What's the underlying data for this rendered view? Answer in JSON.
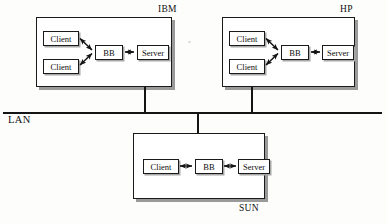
{
  "diagram": {
    "type": "network-architecture",
    "bus": {
      "label": "LAN",
      "orientation": "horizontal"
    },
    "machines": [
      {
        "id": "ibm",
        "caption": "IBM",
        "caption_position": "above-right",
        "attach": "bottom",
        "nodes": [
          {
            "id": "ibm-client-1",
            "label": "Client",
            "role": "client"
          },
          {
            "id": "ibm-client-2",
            "label": "Client",
            "role": "client"
          },
          {
            "id": "ibm-bb",
            "label": "BB",
            "role": "broker"
          },
          {
            "id": "ibm-server",
            "label": "Server",
            "role": "server"
          }
        ],
        "links": [
          {
            "from": "ibm-client-1",
            "to": "ibm-bb",
            "arrows": "both",
            "style": "diagonal"
          },
          {
            "from": "ibm-client-2",
            "to": "ibm-bb",
            "arrows": "both",
            "style": "diagonal"
          },
          {
            "from": "ibm-bb",
            "to": "ibm-server",
            "arrows": "both",
            "style": "horizontal"
          }
        ]
      },
      {
        "id": "hp",
        "caption": "HP",
        "caption_position": "above-right",
        "attach": "bottom",
        "nodes": [
          {
            "id": "hp-client-1",
            "label": "Client",
            "role": "client"
          },
          {
            "id": "hp-client-2",
            "label": "Client",
            "role": "client"
          },
          {
            "id": "hp-bb",
            "label": "BB",
            "role": "broker"
          },
          {
            "id": "hp-server",
            "label": "Server",
            "role": "server"
          }
        ],
        "links": [
          {
            "from": "hp-client-1",
            "to": "hp-bb",
            "arrows": "both",
            "style": "diagonal"
          },
          {
            "from": "hp-client-2",
            "to": "hp-bb",
            "arrows": "both",
            "style": "diagonal"
          },
          {
            "from": "hp-bb",
            "to": "hp-server",
            "arrows": "both",
            "style": "horizontal"
          }
        ]
      },
      {
        "id": "sun",
        "caption": "SUN",
        "caption_position": "below-right",
        "attach": "top",
        "nodes": [
          {
            "id": "sun-client",
            "label": "Client",
            "role": "client"
          },
          {
            "id": "sun-bb",
            "label": "BB",
            "role": "broker"
          },
          {
            "id": "sun-server",
            "label": "Server",
            "role": "server"
          }
        ],
        "links": [
          {
            "from": "sun-client",
            "to": "sun-bb",
            "arrows": "both",
            "style": "horizontal"
          },
          {
            "from": "sun-bb",
            "to": "sun-server",
            "arrows": "both",
            "style": "horizontal"
          }
        ]
      }
    ],
    "colors": {
      "ink": "#141414",
      "paper": "#fdfdfc",
      "shadow": "#9a9a9a"
    }
  }
}
